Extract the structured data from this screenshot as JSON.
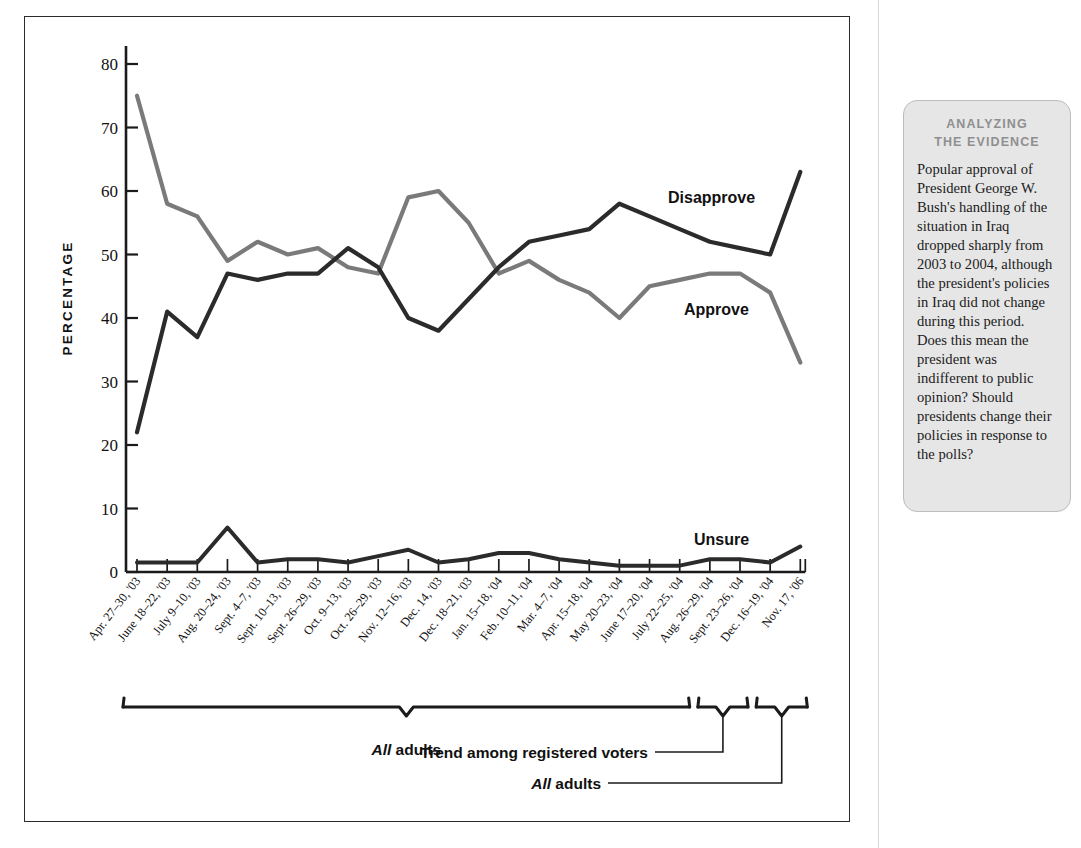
{
  "chart_data": {
    "type": "line",
    "title": "",
    "xlabel": "",
    "ylabel": "PERCENTAGE",
    "ylim": [
      0,
      80
    ],
    "yticks": [
      0,
      10,
      20,
      30,
      40,
      50,
      60,
      70,
      80
    ],
    "grid": false,
    "legend_position": "inline-right",
    "categories": [
      "Apr. 27–30, '03",
      "June 18–22, '03",
      "July 9–10, '03",
      "Aug. 20–24, '03",
      "Sept. 4–7, '03",
      "Sept. 10–13, '03",
      "Sept. 26–29, '03",
      "Oct. 9–13, '03",
      "Oct. 26–29, '03",
      "Nov. 12–16, '03",
      "Dec. 14, '03",
      "Dec. 18–21, '03",
      "Jan. 15–18, '04",
      "Feb. 10–11, '04",
      "Mar. 4–7, '04",
      "Apr. 15–18, '04",
      "May 20–23, '04",
      "June 17–20, '04",
      "July 22–25, '04",
      "Aug. 26–29, '04",
      "Sept. 23–26, '04",
      "Dec. 16–19, '04",
      "Nov. 17, '06"
    ],
    "series": [
      {
        "name": "Approve",
        "color": "#7a7a7a",
        "values": [
          75,
          58,
          56,
          49,
          52,
          50,
          51,
          48,
          47,
          59,
          60,
          55,
          47,
          49,
          46,
          44,
          40,
          45,
          46,
          47,
          47,
          44,
          33
        ]
      },
      {
        "name": "Disapprove",
        "color": "#2b2b2b",
        "values": [
          22,
          41,
          37,
          47,
          46,
          47,
          47,
          51,
          48,
          40,
          38,
          43,
          48,
          52,
          53,
          54,
          58,
          56,
          54,
          52,
          51,
          50,
          63
        ]
      },
      {
        "name": "Unsure",
        "color": "#2b2b2b",
        "values": [
          1.5,
          1.5,
          1.5,
          7,
          1.5,
          2,
          2,
          1.5,
          2.5,
          3.5,
          1.5,
          2,
          3,
          3,
          2,
          1.5,
          1,
          1,
          1,
          2,
          2,
          1.5,
          4
        ]
      }
    ],
    "series_labels": [
      {
        "text": "Disapprove",
        "for": "Disapprove"
      },
      {
        "text": "Approve",
        "for": "Approve"
      },
      {
        "text": "Unsure",
        "for": "Unsure"
      }
    ],
    "group_annotations": [
      {
        "label_em": "All",
        "label": " adults",
        "from": "Apr. 27–30, '03",
        "to": "July 22–25, '04"
      },
      {
        "label_em": "",
        "label": "Trend among registered voters",
        "from": "Aug. 26–29, '04",
        "to": "Sept. 23–26, '04"
      },
      {
        "label_em": "All",
        "label": " adults",
        "from": "Dec. 16–19, '04",
        "to": "Nov. 17, '06"
      }
    ]
  },
  "analyzing_the_evidence": {
    "heading_line1": "ANALYZING",
    "heading_line2": "THE EVIDENCE",
    "body": "Popular approval of President George W. Bush's handling of the situation in Iraq dropped sharply from 2003 to 2004, although the president's policies in Iraq did not change during this period. Does this mean the president was indifferent to public opinion? Should presidents change their policies in response to the polls?"
  }
}
